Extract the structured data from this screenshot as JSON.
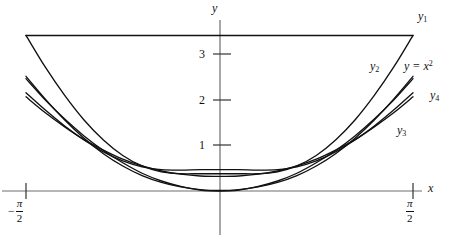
{
  "figure": {
    "kind": "math-plot",
    "background": "#ffffff",
    "ink": "#111111"
  },
  "axes": {
    "x_axis_name": "x",
    "y_axis_name": "y",
    "y_ticks": [
      "1",
      "2",
      "3"
    ],
    "x_tick_left": {
      "sign": "−",
      "numerator": "π",
      "denominator": "2"
    },
    "x_tick_right": {
      "sign": "",
      "numerator": "π",
      "denominator": "2"
    }
  },
  "curve_labels": [
    {
      "id": "y1",
      "base": "y",
      "sub": "1",
      "sup": ""
    },
    {
      "id": "y2",
      "base": "y",
      "sub": "2",
      "sup": ""
    },
    {
      "id": "y3",
      "base": "y",
      "sub": "3",
      "sup": ""
    },
    {
      "id": "y4",
      "base": "y",
      "sub": "4",
      "sup": ""
    },
    {
      "id": "yx2",
      "base": "y = x",
      "sub": "",
      "sup": "2"
    }
  ],
  "chart_data": {
    "type": "line",
    "title": "",
    "xlabel": "x",
    "ylabel": "y",
    "xlim": [
      -1.5707963,
      1.5707963
    ],
    "ylim": [
      -0.75,
      3.75
    ],
    "grid": false,
    "legend": "inline-curve-labels",
    "xtick_values": [
      -1.5707963,
      1.5707963
    ],
    "xtick_labels": [
      "-π/2",
      "π/2"
    ],
    "ytick_values": [
      1,
      2,
      3
    ],
    "ytick_labels": [
      "1",
      "2",
      "3"
    ],
    "annotations": [
      {
        "text": "y1",
        "x": 1.4,
        "y": 3.62
      },
      {
        "text": "y2",
        "x": 1.22,
        "y": 2.52
      },
      {
        "text": "y = x^2",
        "x": 1.47,
        "y": 2.48
      },
      {
        "text": "y4",
        "x": 1.56,
        "y": 2.08
      },
      {
        "text": "y3",
        "x": 1.36,
        "y": 1.42
      }
    ],
    "series": [
      {
        "name": "y1",
        "label": "y₁",
        "kind": "horizontal-line",
        "color": "#111111",
        "constant_value": 3.42,
        "x": [
          -1.5707963,
          1.5707963
        ],
        "values": [
          3.42,
          3.42
        ]
      },
      {
        "name": "y2",
        "label": "y₂",
        "kind": "curve",
        "color": "#111111",
        "x": [
          -1.5708,
          -1.4137,
          -1.2566,
          -1.0996,
          -0.9425,
          -0.7854,
          -0.6283,
          -0.4712,
          -0.3142,
          -0.1571,
          0.0,
          0.1571,
          0.3142,
          0.4712,
          0.6283,
          0.7854,
          0.9425,
          1.0996,
          1.2566,
          1.4137,
          1.5708
        ],
        "values": [
          2.52,
          2.02,
          1.56,
          1.16,
          0.82,
          0.55,
          0.34,
          0.19,
          0.09,
          0.03,
          0.01,
          0.03,
          0.09,
          0.19,
          0.34,
          0.55,
          0.82,
          1.16,
          1.56,
          2.02,
          2.52
        ]
      },
      {
        "name": "yx2",
        "label": "y = x²",
        "kind": "parabola",
        "color": "#111111",
        "x": [
          -1.5708,
          -1.4137,
          -1.2566,
          -1.0996,
          -0.9425,
          -0.7854,
          -0.6283,
          -0.4712,
          -0.3142,
          -0.1571,
          0.0,
          0.1571,
          0.3142,
          0.4712,
          0.6283,
          0.7854,
          0.9425,
          1.0996,
          1.2566,
          1.4137,
          1.5708
        ],
        "values": [
          2.47,
          2.0,
          1.58,
          1.21,
          0.89,
          0.62,
          0.39,
          0.22,
          0.1,
          0.02,
          0.0,
          0.02,
          0.1,
          0.22,
          0.39,
          0.62,
          0.89,
          1.21,
          1.58,
          2.0,
          2.47
        ]
      },
      {
        "name": "y3",
        "label": "y₃",
        "kind": "curve",
        "color": "#111111",
        "x": [
          -1.5708,
          -1.4137,
          -1.2566,
          -1.0996,
          -0.9425,
          -0.7854,
          -0.6283,
          -0.4712,
          -0.3142,
          -0.1571,
          0.0,
          0.1571,
          0.3142,
          0.4712,
          0.6283,
          0.7854,
          0.9425,
          1.0996,
          1.2566,
          1.4137,
          1.5708
        ],
        "values": [
          2.07,
          1.72,
          1.41,
          1.13,
          0.9,
          0.7,
          0.55,
          0.44,
          0.37,
          0.33,
          0.32,
          0.33,
          0.37,
          0.44,
          0.55,
          0.7,
          0.9,
          1.13,
          1.41,
          1.72,
          2.07
        ]
      },
      {
        "name": "y4",
        "label": "y₄",
        "kind": "curve",
        "color": "#111111",
        "x": [
          -1.5708,
          -1.4137,
          -1.2566,
          -1.0996,
          -0.9425,
          -0.7854,
          -0.6283,
          -0.4712,
          -0.3142,
          -0.1571,
          0.0,
          0.1571,
          0.3142,
          0.4712,
          0.6283,
          0.7854,
          0.9425,
          1.0996,
          1.2566,
          1.4137,
          1.5708
        ],
        "values": [
          2.16,
          1.78,
          1.43,
          1.12,
          0.86,
          0.66,
          0.53,
          0.47,
          0.46,
          0.47,
          0.47,
          0.47,
          0.46,
          0.47,
          0.53,
          0.66,
          0.86,
          1.12,
          1.43,
          1.78,
          2.16
        ]
      },
      {
        "name": "y5",
        "label": "",
        "kind": "curve",
        "color": "#111111",
        "x": [
          -1.5708,
          -1.4137,
          -1.2566,
          -1.0996,
          -0.9425,
          -0.7854,
          -0.6283,
          -0.4712,
          -0.3142,
          -0.1571,
          0.0,
          0.1571,
          0.3142,
          0.4712,
          0.6283,
          0.7854,
          0.9425,
          1.0996,
          1.2566,
          1.4137,
          1.5708
        ],
        "values": [
          3.42,
          2.72,
          2.1,
          1.56,
          1.12,
          0.78,
          0.55,
          0.42,
          0.38,
          0.38,
          0.38,
          0.38,
          0.38,
          0.42,
          0.55,
          0.78,
          1.12,
          1.56,
          2.1,
          2.72,
          3.42
        ]
      }
    ]
  }
}
